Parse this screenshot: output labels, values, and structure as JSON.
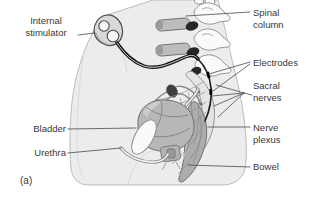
{
  "panel_label": "(a)",
  "labels": {
    "internal_stimulator": {
      "line1": "Internal",
      "line2": "stimulator"
    },
    "spinal_column": {
      "line1": "Spinal",
      "line2": "column"
    },
    "electrodes": {
      "line1": "Electrodes"
    },
    "sacral_nerves": {
      "line1": "Sacral",
      "line2": "nerves"
    },
    "nerve_plexus": {
      "line1": "Nerve",
      "line2": "plexus"
    },
    "bladder": {
      "line1": "Bladder"
    },
    "urethra": {
      "line1": "Urethra"
    },
    "bowel": {
      "line1": "Bowel"
    }
  },
  "colors": {
    "background": "#ffffff",
    "body_fill": "#ececec",
    "body_outline": "#bdbdbd",
    "contour_line": "#d9d9d9",
    "bone_fill": "#fafafa",
    "bone_outline": "#8a8a8a",
    "vertebra_bar_fill": "#bcbcbc",
    "disc_dark": "#262626",
    "sacrum_fill": "#e4e4e4",
    "nerve_line": "#8d8d8d",
    "bladder_fill": "#b7b7b7",
    "organ_outline": "#6d6d6d",
    "bowel_fill": "#adadad",
    "tube_gray": "#8c8c8c",
    "device_fill": "#d9d9d9",
    "device_outline": "#4a4a4a",
    "wire_black": "#151515",
    "label_text": "#383838",
    "leader_line": "#4a4a4a"
  }
}
